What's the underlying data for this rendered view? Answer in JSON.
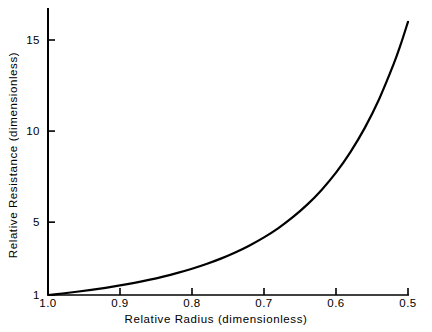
{
  "chart_data": {
    "type": "line",
    "title": "",
    "xlabel": "Relative Radius (dimensionless)",
    "ylabel": "Relative Resistance (dimensionless)",
    "xlim": [
      1.0,
      0.5
    ],
    "ylim": [
      1,
      16.3
    ],
    "x_reversed": true,
    "grid": false,
    "legend": "none",
    "xticks": [
      "1.0",
      "0.9",
      "0.8",
      "0.7",
      "0.6",
      "0.5"
    ],
    "xtick_values": [
      1.0,
      0.9,
      0.8,
      0.7,
      0.6,
      0.5
    ],
    "yticks": [
      "1",
      "5",
      "10",
      "15"
    ],
    "ytick_values": [
      1,
      5,
      10,
      15
    ],
    "series": [
      {
        "name": "Relative Resistance",
        "color": "#000000",
        "x": [
          1.0,
          0.98,
          0.96,
          0.94,
          0.92,
          0.9,
          0.88,
          0.86,
          0.84,
          0.82,
          0.8,
          0.78,
          0.76,
          0.74,
          0.72,
          0.7,
          0.68,
          0.66,
          0.64,
          0.62,
          0.6,
          0.58,
          0.56,
          0.54,
          0.52,
          0.51,
          0.5
        ],
        "values": [
          1.0,
          1.083,
          1.177,
          1.281,
          1.396,
          1.524,
          1.668,
          1.829,
          2.01,
          2.213,
          2.441,
          2.701,
          2.997,
          3.335,
          3.722,
          4.165,
          4.677,
          5.272,
          5.96,
          6.771,
          7.716,
          8.845,
          10.176,
          11.764,
          13.67,
          14.77,
          16.0
        ]
      }
    ]
  },
  "axes": {
    "x_axis_name": "x-axis",
    "y_axis_name": "y-axis"
  }
}
